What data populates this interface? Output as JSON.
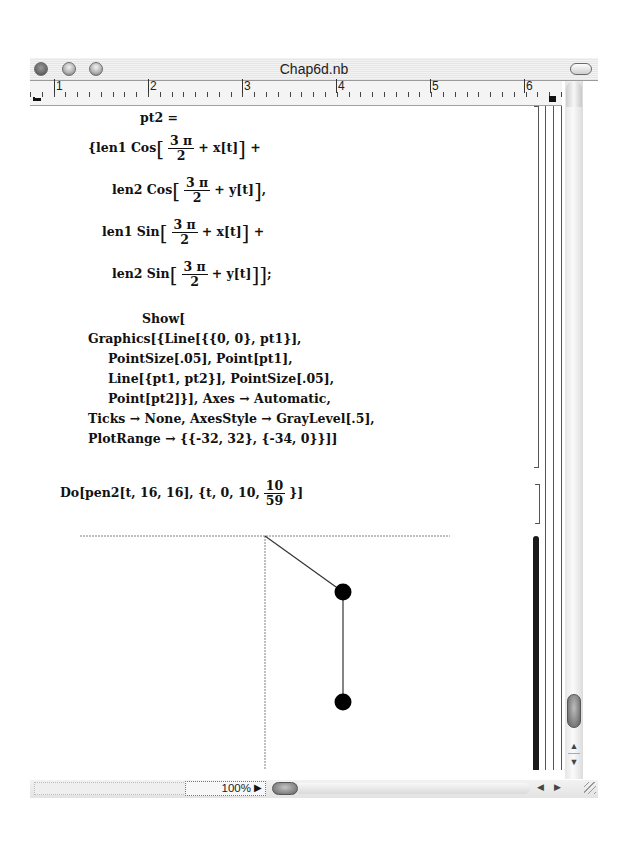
{
  "window": {
    "title": "Chap6d.nb",
    "buttons": {
      "close": "close",
      "minimize": "minimize",
      "zoom": "zoom",
      "toolbar_toggle": "toolbar-toggle"
    }
  },
  "ruler": {
    "marks": [
      "1",
      "2",
      "3",
      "4",
      "5",
      "6"
    ]
  },
  "notebook": {
    "input_cell_1": {
      "lines": [
        "pt2 =",
        "{len1 Cos[3π/2 + x[t]] +",
        "len2 Cos[3π/2 + y[t]],",
        "len1 Sin[3π/2 + x[t]] +",
        "len2 Sin[3π/2 + y[t]]};",
        "Show[",
        "Graphics[{Line[{{0, 0}, pt1}],",
        "PointSize[.05], Point[pt1],",
        "Line[{pt1, pt2}], PointSize[.05],",
        "Point[pt2]}], Axes → Automatic,",
        "Ticks → None, AxesStyle → GrayLevel[.5],",
        "PlotRange → {{-32, 32}, {-34, 0}}]]"
      ],
      "parts": {
        "pt2": "pt2 =",
        "open": "{len1 Cos",
        "frac_num": "3 π",
        "frac_den": "2",
        "xt": "+ x[t]",
        "yt": "+ y[t]",
        "len2cos": "len2 Cos",
        "len1sin": "len1 Sin",
        "len2sin": "len2 Sin",
        "show": "Show[",
        "g1": "Graphics[{Line[{{0, 0}, pt1}],",
        "g2": "PointSize[.05], Point[pt1],",
        "g3": "Line[{pt1, pt2}], PointSize[.05],",
        "g4": "Point[pt2]}], Axes → Automatic,",
        "g5": "Ticks → None, AxesStyle → GrayLevel[.5],",
        "g6": "PlotRange → {{-32, 32}, {-34, 0}}]]"
      }
    },
    "input_cell_2": {
      "text": "Do[pen2[t, 16, 16], {t, 0, 10, 10/59}]",
      "prefix": "Do[pen2[t, 16, 16], {t, 0, 10,",
      "frac_num": "10",
      "frac_den": "59",
      "suffix": "}]"
    },
    "output_graphic": {
      "plot_range": {
        "x": [
          -32,
          32
        ],
        "y": [
          -34,
          0
        ]
      },
      "axes": "Automatic",
      "axes_color": "#808080",
      "origin": [
        0,
        0
      ],
      "pt1": [
        10,
        -9
      ],
      "pt2": [
        10,
        -25
      ],
      "point_color": "#000000"
    }
  },
  "statusbar": {
    "zoom_level": "100%"
  }
}
